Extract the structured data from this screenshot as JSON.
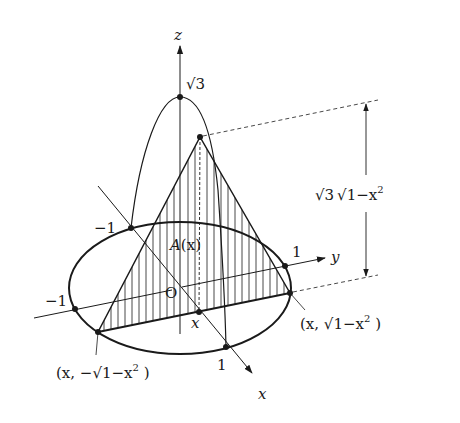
{
  "figure": {
    "axes": {
      "z_label": "z",
      "y_label": "y",
      "x_label": "x",
      "origin_label": "O"
    },
    "ticks": {
      "z_top": "√3",
      "x_neg": "−1",
      "x_pos": "1",
      "y_neg": "−1",
      "y_pos": "1"
    },
    "labels": {
      "area": "A",
      "area_arg": "(x)",
      "section_x": "x",
      "height_sqrt3": "√3",
      "height_sqrt": "√1−x",
      "height_exp": "2",
      "point_right_open": "(x, √1−x",
      "point_right_exp": "2",
      "point_right_close": " )",
      "point_left_open": "(x, −√1−x",
      "point_left_exp": "2",
      "point_left_close": " )"
    },
    "colors": {
      "ink": "#1a1a1a",
      "background": "#ffffff"
    }
  }
}
